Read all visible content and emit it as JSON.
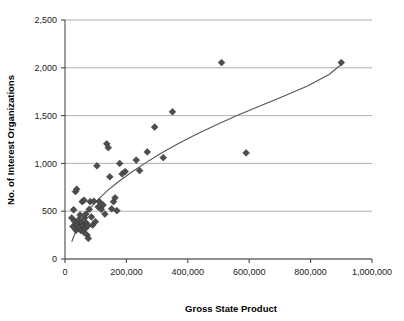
{
  "chart_data": {
    "type": "scatter",
    "title": "",
    "xlabel": "Gross State Product",
    "ylabel": "No. of Interest Organizations",
    "xlim": [
      0,
      1000000
    ],
    "ylim": [
      0,
      2500
    ],
    "xticks": [
      0,
      200000,
      400000,
      600000,
      800000,
      1000000
    ],
    "xticklabels": [
      "0",
      "200,000",
      "400,000",
      "600,000",
      "800,000",
      "1,000,000"
    ],
    "yticks": [
      0,
      500,
      1000,
      1500,
      2000,
      2500
    ],
    "yticklabels": [
      "0",
      "500",
      "1,000",
      "1,500",
      "2,000",
      "2,500"
    ],
    "grid": "horizontal",
    "legend": "none",
    "marker": "diamond",
    "marker_color": "#4d4d4d",
    "trendline": {
      "visible": true,
      "kind": "logarithmic",
      "color": "#555555",
      "points": [
        [
          22000,
          180
        ],
        [
          40000,
          330
        ],
        [
          60000,
          440
        ],
        [
          85000,
          545
        ],
        [
          110000,
          630
        ],
        [
          140000,
          720
        ],
        [
          175000,
          810
        ],
        [
          215000,
          905
        ],
        [
          260000,
          1000
        ],
        [
          310000,
          1100
        ],
        [
          365000,
          1200
        ],
        [
          425000,
          1300
        ],
        [
          490000,
          1400
        ],
        [
          560000,
          1500
        ],
        [
          635000,
          1600
        ],
        [
          710000,
          1700
        ],
        [
          790000,
          1810
        ],
        [
          860000,
          1930
        ],
        [
          900000,
          2035
        ]
      ]
    },
    "points": [
      [
        22000,
        430
      ],
      [
        26000,
        340
      ],
      [
        28000,
        515
      ],
      [
        31000,
        395
      ],
      [
        34000,
        705
      ],
      [
        36000,
        300
      ],
      [
        38000,
        730
      ],
      [
        41000,
        360
      ],
      [
        44000,
        410
      ],
      [
        46000,
        330
      ],
      [
        49000,
        460
      ],
      [
        51000,
        300
      ],
      [
        54000,
        385
      ],
      [
        56000,
        600
      ],
      [
        58000,
        350
      ],
      [
        60000,
        285
      ],
      [
        62000,
        615
      ],
      [
        64000,
        430
      ],
      [
        66000,
        320
      ],
      [
        68000,
        470
      ],
      [
        70000,
        375
      ],
      [
        72000,
        250
      ],
      [
        74000,
        345
      ],
      [
        76000,
        215
      ],
      [
        79000,
        520
      ],
      [
        82000,
        600
      ],
      [
        86000,
        440
      ],
      [
        90000,
        355
      ],
      [
        94000,
        605
      ],
      [
        99000,
        390
      ],
      [
        104000,
        975
      ],
      [
        108000,
        545
      ],
      [
        112000,
        600
      ],
      [
        118000,
        520
      ],
      [
        124000,
        565
      ],
      [
        130000,
        470
      ],
      [
        136000,
        1205
      ],
      [
        141000,
        1165
      ],
      [
        146000,
        860
      ],
      [
        152000,
        525
      ],
      [
        158000,
        600
      ],
      [
        163000,
        640
      ],
      [
        169000,
        505
      ],
      [
        178000,
        1000
      ],
      [
        186000,
        890
      ],
      [
        196000,
        915
      ],
      [
        232000,
        1035
      ],
      [
        243000,
        925
      ],
      [
        268000,
        1120
      ],
      [
        292000,
        1380
      ],
      [
        320000,
        1060
      ],
      [
        350000,
        1540
      ],
      [
        510000,
        2055
      ],
      [
        590000,
        1110
      ],
      [
        900000,
        2055
      ]
    ]
  },
  "axes": {
    "x_axis_name": "x-axis",
    "y_axis_name": "y-axis"
  }
}
